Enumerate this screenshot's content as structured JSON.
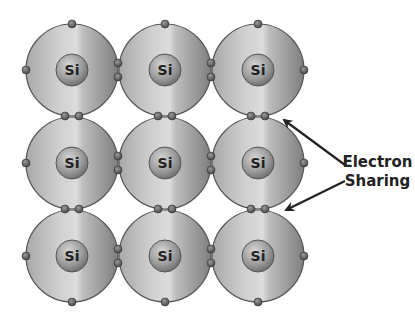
{
  "diagram": {
    "atom_symbol": "Si",
    "grid": {
      "rows": 3,
      "cols": 3
    },
    "atoms": [
      {
        "row": 0,
        "col": 0,
        "symbol": "Si"
      },
      {
        "row": 0,
        "col": 1,
        "symbol": "Si"
      },
      {
        "row": 0,
        "col": 2,
        "symbol": "Si"
      },
      {
        "row": 1,
        "col": 0,
        "symbol": "Si"
      },
      {
        "row": 1,
        "col": 1,
        "symbol": "Si"
      },
      {
        "row": 1,
        "col": 2,
        "symbol": "Si"
      },
      {
        "row": 2,
        "col": 0,
        "symbol": "Si"
      },
      {
        "row": 2,
        "col": 1,
        "symbol": "Si"
      },
      {
        "row": 2,
        "col": 2,
        "symbol": "Si"
      }
    ],
    "annotation": {
      "line1": "Electron",
      "line2": "Sharing"
    },
    "colors": {
      "shell_light": "#d8d8d8",
      "shell_dark": "#8c8c8c",
      "outline": "#555555",
      "nucleus": "#9a9a9a",
      "electron": "#666666",
      "arrow": "#222222"
    }
  }
}
